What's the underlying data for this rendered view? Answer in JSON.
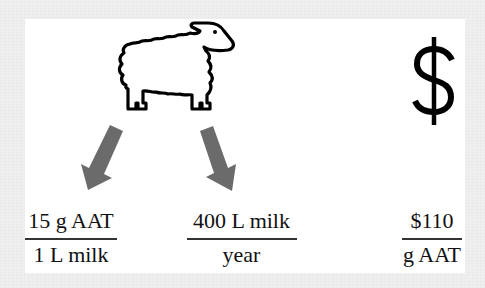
{
  "diagram": {
    "icons": {
      "animal": "sheep-icon",
      "currency": "dollar-sign-icon",
      "arrows": [
        "arrow-down-left-icon",
        "arrow-down-right-icon"
      ]
    },
    "colors": {
      "background": "#efefef",
      "panel": "#ffffff",
      "icon_stroke": "#000000",
      "arrow_fill": "#6b6b6b",
      "text": "#111111"
    },
    "fractions": [
      {
        "numerator": "15 g AAT",
        "denominator": "1 L milk"
      },
      {
        "numerator": "400 L milk",
        "denominator": "year"
      },
      {
        "numerator": "$110",
        "denominator": "g AAT"
      }
    ]
  }
}
